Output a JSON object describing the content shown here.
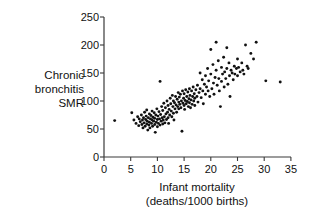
{
  "chart_data": {
    "type": "scatter",
    "title": "",
    "xlabel": "Infant mortality",
    "xlabel_sub": "(deaths/1000 births)",
    "ylabel_lines": [
      "Chronic",
      "bronchitis",
      "SMR"
    ],
    "xlim": [
      0,
      35
    ],
    "ylim": [
      0,
      250
    ],
    "xticks": [
      0,
      5,
      10,
      15,
      20,
      25,
      30,
      35
    ],
    "yticks": [
      0,
      50,
      100,
      150,
      200,
      250
    ],
    "grid": false,
    "legend": "none",
    "marker": "filled-circle",
    "marker_color": "#111111",
    "points": [
      [
        2.0,
        65
      ],
      [
        5.2,
        79
      ],
      [
        5.6,
        66
      ],
      [
        6.0,
        60
      ],
      [
        6.3,
        72
      ],
      [
        6.5,
        56
      ],
      [
        6.6,
        68
      ],
      [
        6.8,
        63
      ],
      [
        7.0,
        75
      ],
      [
        7.1,
        58
      ],
      [
        7.2,
        66
      ],
      [
        7.3,
        52
      ],
      [
        7.4,
        70
      ],
      [
        7.5,
        61
      ],
      [
        7.6,
        80
      ],
      [
        7.7,
        55
      ],
      [
        7.8,
        67
      ],
      [
        7.9,
        73
      ],
      [
        8.0,
        59
      ],
      [
        8.0,
        84
      ],
      [
        8.1,
        64
      ],
      [
        8.2,
        48
      ],
      [
        8.3,
        70
      ],
      [
        8.4,
        57
      ],
      [
        8.5,
        77
      ],
      [
        8.5,
        62
      ],
      [
        8.6,
        52
      ],
      [
        8.7,
        68
      ],
      [
        8.8,
        74
      ],
      [
        8.9,
        60
      ],
      [
        9.0,
        82
      ],
      [
        9.0,
        66
      ],
      [
        9.1,
        55
      ],
      [
        9.2,
        71
      ],
      [
        9.3,
        64
      ],
      [
        9.4,
        79
      ],
      [
        9.5,
        58
      ],
      [
        9.5,
        69
      ],
      [
        9.6,
        44
      ],
      [
        9.7,
        75
      ],
      [
        9.8,
        62
      ],
      [
        9.9,
        86
      ],
      [
        10.0,
        67
      ],
      [
        10.0,
        54
      ],
      [
        10.1,
        73
      ],
      [
        10.2,
        60
      ],
      [
        10.3,
        81
      ],
      [
        10.4,
        68
      ],
      [
        10.5,
        135
      ],
      [
        10.5,
        57
      ],
      [
        10.6,
        76
      ],
      [
        10.7,
        64
      ],
      [
        10.8,
        90
      ],
      [
        10.9,
        70
      ],
      [
        11.0,
        59
      ],
      [
        11.0,
        83
      ],
      [
        11.1,
        66
      ],
      [
        11.2,
        96
      ],
      [
        11.3,
        72
      ],
      [
        11.4,
        61
      ],
      [
        11.5,
        88
      ],
      [
        11.6,
        77
      ],
      [
        11.7,
        67
      ],
      [
        11.8,
        100
      ],
      [
        11.9,
        80
      ],
      [
        12.0,
        70
      ],
      [
        12.0,
        92
      ],
      [
        12.1,
        60
      ],
      [
        12.2,
        85
      ],
      [
        12.3,
        75
      ],
      [
        12.4,
        105
      ],
      [
        12.5,
        95
      ],
      [
        12.6,
        82
      ],
      [
        12.7,
        72
      ],
      [
        12.8,
        110
      ],
      [
        12.9,
        90
      ],
      [
        13.0,
        100
      ],
      [
        13.0,
        78
      ],
      [
        13.1,
        66
      ],
      [
        13.2,
        97
      ],
      [
        13.3,
        86
      ],
      [
        13.4,
        108
      ],
      [
        13.5,
        93
      ],
      [
        13.6,
        80
      ],
      [
        13.7,
        103
      ],
      [
        13.8,
        90
      ],
      [
        13.9,
        115
      ],
      [
        14.0,
        98
      ],
      [
        14.0,
        86
      ],
      [
        14.1,
        107
      ],
      [
        14.2,
        94
      ],
      [
        14.3,
        112
      ],
      [
        14.4,
        88
      ],
      [
        14.5,
        100
      ],
      [
        14.6,
        46
      ],
      [
        14.7,
        118
      ],
      [
        14.8,
        96
      ],
      [
        14.9,
        105
      ],
      [
        15.0,
        92
      ],
      [
        15.0,
        113
      ],
      [
        15.1,
        85
      ],
      [
        15.2,
        101
      ],
      [
        15.3,
        120
      ],
      [
        15.4,
        95
      ],
      [
        15.5,
        108
      ],
      [
        15.6,
        99
      ],
      [
        15.7,
        116
      ],
      [
        15.8,
        90
      ],
      [
        15.9,
        104
      ],
      [
        16.0,
        122
      ],
      [
        16.0,
        97
      ],
      [
        16.1,
        110
      ],
      [
        16.2,
        88
      ],
      [
        16.3,
        102
      ],
      [
        16.4,
        118
      ],
      [
        16.5,
        94
      ],
      [
        16.6,
        108
      ],
      [
        16.7,
        125
      ],
      [
        16.8,
        100
      ],
      [
        16.9,
        113
      ],
      [
        17.0,
        105
      ],
      [
        17.0,
        92
      ],
      [
        17.2,
        120
      ],
      [
        17.4,
        108
      ],
      [
        17.5,
        128
      ],
      [
        17.6,
        98
      ],
      [
        17.8,
        115
      ],
      [
        18.0,
        150
      ],
      [
        18.0,
        122
      ],
      [
        18.2,
        106
      ],
      [
        18.4,
        138
      ],
      [
        18.5,
        118
      ],
      [
        18.6,
        95
      ],
      [
        18.8,
        130
      ],
      [
        19.0,
        145
      ],
      [
        19.0,
        112
      ],
      [
        19.2,
        125
      ],
      [
        19.4,
        158
      ],
      [
        19.5,
        118
      ],
      [
        19.6,
        136
      ],
      [
        19.8,
        108
      ],
      [
        20.0,
        192
      ],
      [
        20.0,
        148
      ],
      [
        20.2,
        122
      ],
      [
        20.4,
        165
      ],
      [
        20.5,
        132
      ],
      [
        20.6,
        112
      ],
      [
        20.8,
        142
      ],
      [
        21.0,
        205
      ],
      [
        21.0,
        155
      ],
      [
        21.2,
        128
      ],
      [
        21.4,
        172
      ],
      [
        21.5,
        140
      ],
      [
        21.6,
        118
      ],
      [
        21.8,
        90
      ],
      [
        22.0,
        160
      ],
      [
        22.0,
        135
      ],
      [
        22.2,
        148
      ],
      [
        22.4,
        178
      ],
      [
        22.5,
        125
      ],
      [
        22.6,
        152
      ],
      [
        22.8,
        140
      ],
      [
        23.0,
        195
      ],
      [
        23.0,
        158
      ],
      [
        23.2,
        130
      ],
      [
        23.4,
        168
      ],
      [
        23.5,
        145
      ],
      [
        23.6,
        108
      ],
      [
        23.8,
        155
      ],
      [
        24.0,
        150
      ],
      [
        24.2,
        138
      ],
      [
        24.4,
        162
      ],
      [
        24.5,
        148
      ],
      [
        24.8,
        158
      ],
      [
        25.0,
        175
      ],
      [
        25.0,
        145
      ],
      [
        25.2,
        160
      ],
      [
        25.5,
        152
      ],
      [
        25.8,
        168
      ],
      [
        26.0,
        155
      ],
      [
        26.2,
        148
      ],
      [
        26.5,
        200
      ],
      [
        26.8,
        162
      ],
      [
        27.0,
        158
      ],
      [
        27.5,
        185
      ],
      [
        28.0,
        175
      ],
      [
        28.5,
        205
      ],
      [
        30.3,
        136
      ],
      [
        33.0,
        134
      ]
    ]
  },
  "axis": {
    "ytick_labels": [
      "0",
      "50",
      "100",
      "150",
      "200",
      "250"
    ],
    "xtick_labels": [
      "0",
      "5",
      "10",
      "15",
      "20",
      "25",
      "30",
      "35"
    ]
  }
}
